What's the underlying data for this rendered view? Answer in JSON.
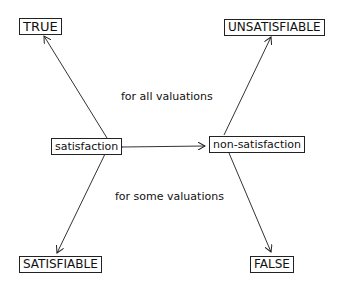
{
  "nodes": {
    "true": "TRUE",
    "unsatisfiable": "UNSATISFIABLE",
    "satisfaction": "satisfaction",
    "non_satisfaction": "non-satisfaction",
    "satisfiable": "SATISFIABLE",
    "false": "FALSE"
  },
  "labels": {
    "for_all": "for all valuations",
    "for_some": "for some valuations"
  },
  "edges": [
    {
      "from": "satisfaction",
      "to": "TRUE"
    },
    {
      "from": "non-satisfaction",
      "to": "UNSATISFIABLE"
    },
    {
      "from": "satisfaction",
      "to": "non-satisfaction",
      "bidirectional": true
    },
    {
      "from": "satisfaction",
      "to": "SATISFIABLE"
    },
    {
      "from": "non-satisfaction",
      "to": "FALSE"
    }
  ]
}
